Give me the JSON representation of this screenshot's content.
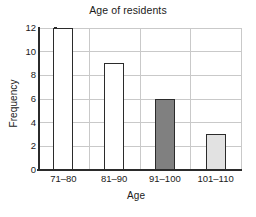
{
  "chart_data": {
    "type": "bar",
    "title": "Age of residents",
    "xlabel": "Age",
    "ylabel": "Frequency",
    "categories": [
      "71–80",
      "81–90",
      "91–100",
      "101–110"
    ],
    "values": [
      12,
      9,
      6,
      3
    ],
    "ylim": [
      0,
      12
    ],
    "yticks": [
      0,
      2,
      4,
      6,
      8,
      10,
      12
    ],
    "ytick_labels": [
      "0",
      "2",
      "4",
      "6",
      "8",
      "10",
      "12"
    ],
    "grid": true,
    "grid_axes": "both",
    "legend": false,
    "bar_colors": [
      "#ffffff",
      "#ffffff",
      "#808080",
      "#e2e2e2"
    ],
    "bar_edge_color": "#2b2b2b",
    "grid_color": "#c9c9c9",
    "axis_color": "#2b2b2b",
    "background": "#ffffff"
  }
}
